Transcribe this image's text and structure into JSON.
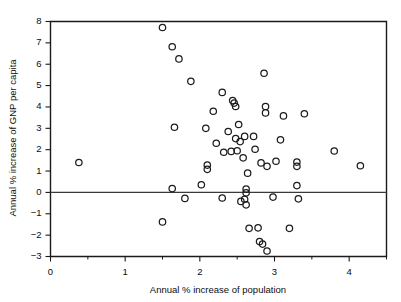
{
  "chart_data": {
    "type": "scatter",
    "title": "",
    "xlabel": "Annual % increase of population",
    "ylabel": "Annual % increase of GNP per capita",
    "xlim": [
      0,
      4.5
    ],
    "ylim": [
      -3,
      8
    ],
    "xticks": [
      0,
      1,
      2,
      3,
      4
    ],
    "xticklabels": [
      "0",
      "1",
      "2",
      "3",
      "4"
    ],
    "xticks_minor": [
      0.5,
      1.5,
      2.5,
      3.5,
      4.5
    ],
    "yticks": [
      -3,
      -2,
      -1,
      0,
      1,
      2,
      3,
      4,
      5,
      6,
      7,
      8
    ],
    "yticklabels": [
      "−3",
      "−2",
      "−1",
      "0",
      "1",
      "2",
      "3",
      "4",
      "5",
      "6",
      "7",
      "8"
    ],
    "grid": false,
    "legend": null,
    "marker": "open-circle",
    "zero_reference_line": 0,
    "points": [
      [
        0.38,
        1.4
      ],
      [
        1.5,
        7.72
      ],
      [
        1.5,
        -1.38
      ],
      [
        1.63,
        6.82
      ],
      [
        1.63,
        0.18
      ],
      [
        1.72,
        6.25
      ],
      [
        1.8,
        -0.28
      ],
      [
        1.88,
        5.2
      ],
      [
        1.66,
        3.05
      ],
      [
        2.02,
        0.36
      ],
      [
        2.08,
        3.0
      ],
      [
        2.1,
        1.28
      ],
      [
        2.1,
        1.08
      ],
      [
        2.18,
        3.8
      ],
      [
        2.22,
        2.3
      ],
      [
        2.3,
        4.68
      ],
      [
        2.3,
        -0.26
      ],
      [
        2.32,
        1.88
      ],
      [
        2.38,
        2.85
      ],
      [
        2.42,
        1.92
      ],
      [
        2.44,
        4.3
      ],
      [
        2.46,
        4.18
      ],
      [
        2.48,
        2.52
      ],
      [
        2.48,
        4.02
      ],
      [
        2.5,
        1.95
      ],
      [
        2.52,
        3.18
      ],
      [
        2.54,
        2.38
      ],
      [
        2.55,
        -0.42
      ],
      [
        2.58,
        1.62
      ],
      [
        2.6,
        2.62
      ],
      [
        2.6,
        -0.32
      ],
      [
        2.62,
        0.16
      ],
      [
        2.62,
        -0.02
      ],
      [
        2.62,
        -0.58
      ],
      [
        2.64,
        0.9
      ],
      [
        2.66,
        -1.68
      ],
      [
        2.72,
        2.62
      ],
      [
        2.74,
        2.02
      ],
      [
        2.78,
        -1.66
      ],
      [
        2.8,
        -2.3
      ],
      [
        2.82,
        1.38
      ],
      [
        2.84,
        -2.42
      ],
      [
        2.86,
        5.58
      ],
      [
        2.88,
        3.72
      ],
      [
        2.88,
        4.02
      ],
      [
        2.9,
        -2.74
      ],
      [
        2.9,
        1.22
      ],
      [
        2.98,
        -0.22
      ],
      [
        3.02,
        1.46
      ],
      [
        3.08,
        2.46
      ],
      [
        3.12,
        3.58
      ],
      [
        3.2,
        -1.68
      ],
      [
        3.3,
        1.42
      ],
      [
        3.3,
        1.22
      ],
      [
        3.3,
        0.32
      ],
      [
        3.32,
        -0.3
      ],
      [
        3.4,
        3.68
      ],
      [
        3.8,
        1.94
      ],
      [
        4.15,
        1.25
      ]
    ]
  },
  "axes": {
    "x_title": "Annual % increase of population",
    "y_title": "Annual % increase of GNP per capita"
  }
}
